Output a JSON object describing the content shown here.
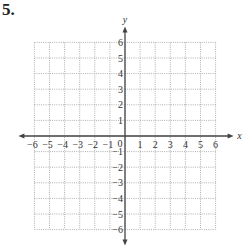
{
  "problem": {
    "number": "5."
  },
  "axes": {
    "x_label": "x",
    "y_label": "y",
    "origin_label": "0",
    "x_ticks": [
      "-6",
      "-5",
      "-4",
      "-3",
      "-2",
      "-1",
      "1",
      "2",
      "3",
      "4",
      "5",
      "6"
    ],
    "y_ticks": [
      "6",
      "5",
      "4",
      "3",
      "2",
      "1",
      "-1",
      "-2",
      "-3",
      "-4",
      "-5",
      "-6"
    ],
    "x_range": [
      -6,
      6
    ],
    "y_range": [
      -6,
      6
    ]
  },
  "chart_data": {
    "type": "scatter",
    "title": "",
    "xlabel": "x",
    "ylabel": "y",
    "xlim": [
      -6,
      6
    ],
    "ylim": [
      -6,
      6
    ],
    "x_tick_labels": [
      "−6",
      "−5",
      "−4",
      "−3",
      "−2",
      "−1",
      "0",
      "1",
      "2",
      "3",
      "4",
      "5",
      "6"
    ],
    "y_tick_labels": [
      "−6",
      "−5",
      "−4",
      "−3",
      "−2",
      "−1",
      "1",
      "2",
      "3",
      "4",
      "5",
      "6"
    ],
    "grid": true,
    "grid_style": "dotted",
    "series": []
  },
  "colors": {
    "axis": "#444444",
    "grid": "#9a9a9a",
    "text": "#333333"
  }
}
